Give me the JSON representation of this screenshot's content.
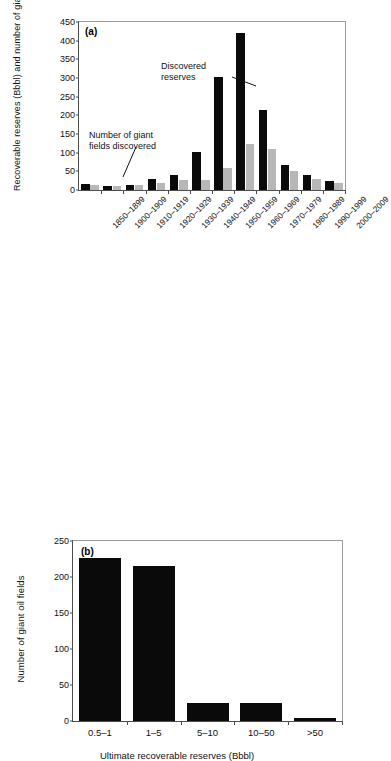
{
  "figure": {
    "background": "#ffffff",
    "dark_color": "#0a0a0a",
    "grey_color": "#b7b7b7",
    "axis_color": "#4d4d4d"
  },
  "panel_a": {
    "tag": "(a)",
    "ylabel": "Recoverable reserves (Bbbl) and number of giant oil fields",
    "yticks": [
      "0",
      "50",
      "100",
      "150",
      "200",
      "250",
      "300",
      "350",
      "400",
      "450"
    ],
    "annotation_reserves": "Discovered\nreserves",
    "annotation_reserves_line1": "Discovered",
    "annotation_reserves_line2": "reserves",
    "annotation_fields_line1": "Number of giant",
    "annotation_fields_line2": "fields discovered",
    "categories": [
      "1850–1899",
      "1900–1909",
      "1910–1919",
      "1920–1929",
      "1930–1939",
      "1940–1949",
      "1950–1959",
      "1960–1969",
      "1970–1979",
      "1980–1989",
      "1990–1999",
      "2000–2009"
    ]
  },
  "panel_b": {
    "tag": "(b)",
    "ylabel": "Number of giant oil fields",
    "xlabel": "Ultimate recoverable reserves (Bbbl)",
    "yticks": [
      "0",
      "50",
      "100",
      "150",
      "200",
      "250"
    ],
    "categories": [
      "0.5–1",
      "1–5",
      "5–10",
      "10–50",
      ">50"
    ]
  },
  "chart_data": [
    {
      "type": "bar",
      "panel": "(a)",
      "title": "",
      "xlabel": "",
      "ylabel": "Recoverable reserves (Bbbl) and number of giant oil fields",
      "categories": [
        "1850–1899",
        "1900–1909",
        "1910–1919",
        "1920–1929",
        "1930–1939",
        "1940–1949",
        "1950–1959",
        "1960–1969",
        "1970–1979",
        "1980–1989",
        "1990–1999",
        "2000–2009"
      ],
      "series": [
        {
          "name": "Discovered reserves",
          "color": "#0a0a0a",
          "values": [
            15,
            11,
            14,
            30,
            40,
            101,
            302,
            420,
            213,
            68,
            39,
            24
          ]
        },
        {
          "name": "Number of giant fields discovered",
          "color": "#b7b7b7",
          "values": [
            13,
            11,
            13,
            18,
            28,
            28,
            58,
            123,
            109,
            50,
            29,
            18
          ]
        }
      ],
      "ylim": [
        0,
        450
      ],
      "ytick_step": 50,
      "grid": false,
      "legend": "inline-annotations",
      "annotations": [
        {
          "text": "Discovered reserves",
          "points_to": "1960–1969 dark bar"
        },
        {
          "text": "Number of giant fields discovered",
          "points_to": "1900–1909 grey bar"
        }
      ]
    },
    {
      "type": "bar",
      "panel": "(b)",
      "title": "",
      "xlabel": "Ultimate recoverable reserves (Bbbl)",
      "ylabel": "Number of giant oil fields",
      "categories": [
        "0.5–1",
        "1–5",
        "5–10",
        "10–50",
        ">50"
      ],
      "values": [
        226,
        215,
        25,
        25,
        4
      ],
      "color": "#0a0a0a",
      "ylim": [
        0,
        250
      ],
      "ytick_step": 50,
      "grid": false,
      "legend": "none"
    }
  ]
}
